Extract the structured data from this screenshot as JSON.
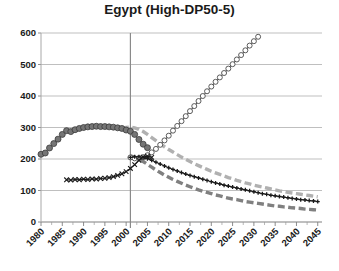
{
  "chart_data": {
    "type": "line",
    "title": "Egypt (High-DP50-5)",
    "xlabel": "",
    "ylabel": "",
    "xlim": [
      1980,
      2046
    ],
    "ylim": [
      0,
      600
    ],
    "ytick_step": 100,
    "xtick_step": 5,
    "grid": "horizontal-plus-one-vertical",
    "legend": "none",
    "yticks": [
      "0",
      "100",
      "200",
      "300",
      "400",
      "500",
      "600"
    ],
    "xticks": [
      "1980",
      "1985",
      "1990",
      "1995",
      "2000",
      "2005",
      "2010",
      "2015",
      "2020",
      "2025",
      "2030",
      "2035",
      "2040",
      "2045"
    ],
    "vertical_marker_year": 2001,
    "series": [
      {
        "name": "historical-observed",
        "marker": "filled-circle",
        "color": "#6b6b6b",
        "line": "none",
        "x": [
          1980,
          1981,
          1982,
          1983,
          1984,
          1985,
          1986,
          1987,
          1988,
          1989,
          1990,
          1991,
          1992,
          1993,
          1994,
          1995,
          1996,
          1997,
          1998,
          1999,
          2000,
          2001,
          2002,
          2003,
          2004,
          2005
        ],
        "y": [
          215,
          219,
          235,
          249,
          263,
          278,
          290,
          287,
          293,
          297,
          300,
          302,
          303,
          304,
          303,
          303,
          302,
          301,
          299,
          297,
          292,
          288,
          278,
          262,
          247,
          236
        ]
      },
      {
        "name": "projection-rising",
        "marker": "open-circle",
        "color": "#555555",
        "line": "solid",
        "x": [
          2001,
          2002,
          2003,
          2004,
          2005,
          2006,
          2007,
          2008,
          2009,
          2010,
          2011,
          2012,
          2013,
          2014,
          2015,
          2016,
          2017,
          2018,
          2019,
          2020,
          2021,
          2022,
          2023,
          2024,
          2025,
          2026,
          2027,
          2028,
          2029,
          2030,
          2031
        ],
        "y": [
          205,
          202,
          203,
          206,
          212,
          221,
          232,
          245,
          259,
          274,
          290,
          305,
          320,
          336,
          352,
          368,
          384,
          400,
          415,
          430,
          445,
          459,
          473,
          487,
          501,
          516,
          530,
          545,
          560,
          574,
          588
        ]
      },
      {
        "name": "projection-crossing-declining",
        "marker": "x-cross",
        "color": "#1a1a1a",
        "line": "solid",
        "x": [
          1986,
          1987,
          1988,
          1989,
          1990,
          1991,
          1992,
          1993,
          1994,
          1995,
          1996,
          1997,
          1998,
          1999,
          2000,
          2001,
          2002,
          2003,
          2004,
          2005,
          2006
        ],
        "y": [
          134,
          133,
          135,
          134,
          136,
          135,
          137,
          136,
          138,
          139,
          141,
          144,
          148,
          153,
          160,
          170,
          182,
          196,
          206,
          209,
          205
        ]
      },
      {
        "name": "projection-plus-declining",
        "marker": "plus",
        "color": "#1a1a1a",
        "line": "solid",
        "x": [
          2001,
          2002,
          2003,
          2004,
          2005,
          2006,
          2007,
          2008,
          2009,
          2010,
          2011,
          2012,
          2013,
          2014,
          2015,
          2016,
          2017,
          2018,
          2019,
          2020,
          2021,
          2022,
          2023,
          2024,
          2025,
          2026,
          2027,
          2028,
          2029,
          2030,
          2031,
          2032,
          2033,
          2034,
          2035,
          2036,
          2037,
          2038,
          2039,
          2040,
          2041,
          2042,
          2043,
          2044,
          2045
        ],
        "y": [
          205,
          207,
          207,
          205,
          201,
          196,
          190,
          184,
          178,
          172,
          167,
          162,
          157,
          152,
          148,
          144,
          140,
          136,
          132,
          128,
          124,
          121,
          117,
          114,
          111,
          108,
          105,
          102,
          99,
          96,
          93,
          90,
          88,
          85,
          83,
          81,
          79,
          77,
          75,
          73,
          71,
          70,
          68,
          67,
          65
        ]
      },
      {
        "name": "projection-light-gray-dashed",
        "marker": "none",
        "color": "#b0b0b0",
        "line": "dashed",
        "x": [
          1999,
          2000,
          2001,
          2002,
          2003,
          2004,
          2005,
          2006,
          2007,
          2008,
          2009,
          2010,
          2011,
          2012,
          2013,
          2014,
          2015,
          2016,
          2017,
          2018,
          2019,
          2020,
          2021,
          2022,
          2023,
          2024,
          2025,
          2026,
          2027,
          2028,
          2029,
          2030,
          2031,
          2032,
          2033,
          2034,
          2035,
          2036,
          2037,
          2038,
          2039,
          2040,
          2041,
          2042,
          2043,
          2044,
          2045
        ],
        "y": [
          298,
          300,
          301,
          299,
          294,
          287,
          278,
          268,
          258,
          248,
          239,
          230,
          222,
          214,
          206,
          199,
          192,
          185,
          179,
          173,
          167,
          161,
          156,
          151,
          146,
          141,
          137,
          132,
          128,
          124,
          121,
          117,
          114,
          111,
          108,
          105,
          102,
          99,
          97,
          94,
          92,
          90,
          88,
          86,
          84,
          82,
          80
        ]
      },
      {
        "name": "projection-dark-gray-dashed",
        "marker": "none",
        "color": "#808080",
        "line": "dashed",
        "x": [
          2001,
          2002,
          2003,
          2004,
          2005,
          2006,
          2007,
          2008,
          2009,
          2010,
          2011,
          2012,
          2013,
          2014,
          2015,
          2016,
          2017,
          2018,
          2019,
          2020,
          2021,
          2022,
          2023,
          2024,
          2025,
          2026,
          2027,
          2028,
          2029,
          2030,
          2031,
          2032,
          2033,
          2034,
          2035,
          2036,
          2037,
          2038,
          2039,
          2040,
          2041,
          2042,
          2043,
          2044,
          2045
        ],
        "y": [
          210,
          206,
          200,
          192,
          183,
          174,
          165,
          157,
          149,
          142,
          135,
          129,
          123,
          117,
          112,
          107,
          102,
          98,
          94,
          90,
          86,
          83,
          79,
          76,
          73,
          71,
          68,
          65,
          63,
          61,
          59,
          57,
          55,
          53,
          51,
          50,
          48,
          47,
          45,
          44,
          43,
          41,
          40,
          39,
          38
        ]
      }
    ]
  }
}
